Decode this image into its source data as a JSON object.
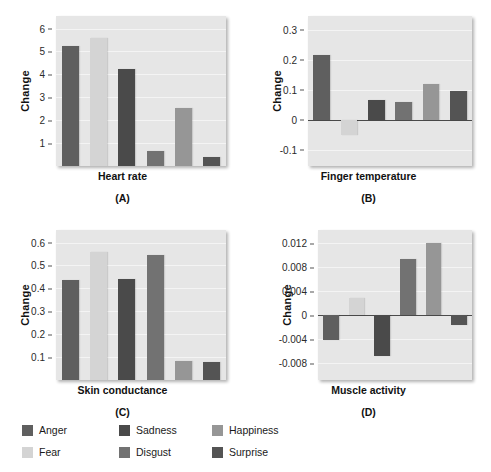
{
  "figure": {
    "series_names": [
      "Anger",
      "Fear",
      "Sadness",
      "Disgust",
      "Happiness",
      "Surprise"
    ],
    "series_colors": [
      "#5f5f5f",
      "#d4d4d4",
      "#4a4a4a",
      "#727272",
      "#969696",
      "#545454"
    ],
    "axis_label": "Change",
    "panels": [
      {
        "id": "A",
        "caption": "(A)",
        "xlabel": "Heart rate",
        "ticks": [
          "6",
          "5",
          "4",
          "3",
          "2",
          "1"
        ],
        "tick_values": [
          6,
          5,
          4,
          3,
          2,
          1
        ],
        "values": [
          5.25,
          5.6,
          4.25,
          0.65,
          2.55,
          0.4
        ],
        "ymin": 0,
        "ymax": 6.55
      },
      {
        "id": "B",
        "caption": "(B)",
        "xlabel": "Finger temperature",
        "ticks": [
          "0.3",
          "0.2",
          "0.1",
          "0",
          "-0.1"
        ],
        "tick_values": [
          0.3,
          0.2,
          0.1,
          0,
          -0.1
        ],
        "values": [
          0.215,
          -0.05,
          0.065,
          0.06,
          0.12,
          0.095
        ],
        "ymin": -0.155,
        "ymax": 0.345
      },
      {
        "id": "C",
        "caption": "(C)",
        "xlabel": "Skin conductance",
        "ticks": [
          "0.6",
          "0.5",
          "0.4",
          "0.3",
          "0.2",
          "0.1"
        ],
        "tick_values": [
          0.6,
          0.5,
          0.4,
          0.3,
          0.2,
          0.1
        ],
        "values": [
          0.435,
          0.56,
          0.44,
          0.545,
          0.085,
          0.08
        ],
        "ymin": 0,
        "ymax": 0.655
      },
      {
        "id": "D",
        "caption": "(D)",
        "xlabel": "Muscle activity",
        "ticks": [
          "0.012",
          "0.008",
          "0.004",
          "0",
          "-0.004",
          "-0.008"
        ],
        "tick_values": [
          0.012,
          0.008,
          0.004,
          0,
          -0.004,
          -0.008
        ],
        "values": [
          -0.0042,
          0.0028,
          -0.0068,
          0.0094,
          0.0121,
          -0.0017
        ],
        "ymin": -0.0108,
        "ymax": 0.0142
      }
    ]
  },
  "legend": {
    "items": [
      {
        "label": "Anger",
        "color": "#5f5f5f"
      },
      {
        "label": "Sadness",
        "color": "#4a4a4a"
      },
      {
        "label": "Happiness",
        "color": "#969696"
      },
      {
        "label": "Fear",
        "color": "#d4d4d4"
      },
      {
        "label": "Disgust",
        "color": "#727272"
      },
      {
        "label": "Surprise",
        "color": "#545454"
      }
    ]
  },
  "chart_data": {
    "type": "bar",
    "title": "",
    "categories": [
      "Anger",
      "Fear",
      "Sadness",
      "Disgust",
      "Happiness",
      "Surprise"
    ],
    "grid": true,
    "legend_position": "bottom-left",
    "panels": [
      {
        "panel": "A",
        "title": "Heart rate",
        "caption": "(A)",
        "ylabel": "Change",
        "xlabel": "Heart rate",
        "yticks": [
          1,
          2,
          3,
          4,
          5,
          6
        ],
        "ylim": [
          0,
          6.55
        ],
        "series": [
          {
            "name": "values",
            "values": [
              5.25,
              5.6,
              4.25,
              0.65,
              2.55,
              0.4
            ]
          }
        ]
      },
      {
        "panel": "B",
        "title": "Finger temperature",
        "caption": "(B)",
        "ylabel": "Change",
        "xlabel": "Finger temperature",
        "yticks": [
          -0.1,
          0,
          0.1,
          0.2,
          0.3
        ],
        "ylim": [
          -0.155,
          0.345
        ],
        "series": [
          {
            "name": "values",
            "values": [
              0.215,
              -0.05,
              0.065,
              0.06,
              0.12,
              0.095
            ]
          }
        ]
      },
      {
        "panel": "C",
        "title": "Skin conductance",
        "caption": "(C)",
        "ylabel": "Change",
        "xlabel": "Skin conductance",
        "yticks": [
          0.1,
          0.2,
          0.3,
          0.4,
          0.5,
          0.6
        ],
        "ylim": [
          0,
          0.655
        ],
        "series": [
          {
            "name": "values",
            "values": [
              0.435,
              0.56,
              0.44,
              0.545,
              0.085,
              0.08
            ]
          }
        ]
      },
      {
        "panel": "D",
        "title": "Muscle activity",
        "caption": "(D)",
        "ylabel": "Change",
        "xlabel": "Muscle activity",
        "yticks": [
          -0.008,
          -0.004,
          0,
          0.004,
          0.008,
          0.012
        ],
        "ylim": [
          -0.0108,
          0.0142
        ],
        "series": [
          {
            "name": "values",
            "values": [
              -0.0042,
              0.0028,
              -0.0068,
              0.0094,
              0.0121,
              -0.0017
            ]
          }
        ]
      }
    ]
  }
}
